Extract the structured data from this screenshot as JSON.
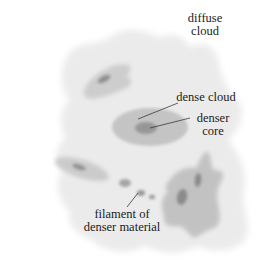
{
  "diagram": {
    "title": "",
    "labels": {
      "diffuse_cloud": [
        "diffuse",
        "cloud"
      ],
      "dense_cloud": "dense cloud",
      "denser_core": [
        "denser",
        "core"
      ],
      "filament": [
        "filament of",
        "denser material"
      ]
    },
    "colors": {
      "background": "#ffffff",
      "diffuse_cloud": "#ebebeb",
      "dense_cloud": "#c4c4c4",
      "denser_core": "#969696",
      "leader_line": "#3a3a3a",
      "text": "#1c1c1c"
    }
  }
}
